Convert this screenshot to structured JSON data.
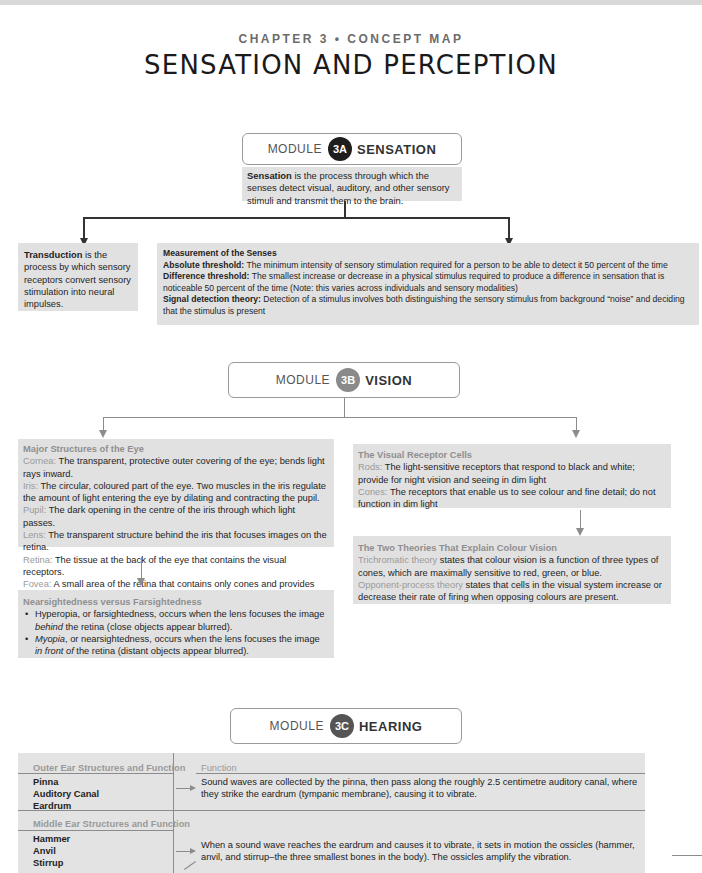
{
  "header": {
    "chapter_label": "CHAPTER 3 • CONCEPT MAP",
    "title": "SENSATION AND PERCEPTION"
  },
  "colors": {
    "badge_3a": "#1e1e1e",
    "badge_3b": "#8a8a8a",
    "badge_3c": "#555555",
    "box_fill": "#e1e1e1",
    "label_grey": "#9a9a9a"
  },
  "module_3a": {
    "word": "MODULE",
    "badge": "3A",
    "name": "SENSATION",
    "definition_term": "Sensation",
    "definition_rest": " is the process through which the senses detect visual, auditory, and other sensory stimuli and transmit them to the brain.",
    "transduction_term": "Transduction",
    "transduction_rest": " is the process by which sensory receptors convert sensory stimulation into neural impulses.",
    "measurement": {
      "heading": "Measurement of the Senses",
      "items": [
        {
          "term": "Absolute threshold:",
          "text": " The minimum intensity of sensory stimulation required for a person to be able to detect it 50 percent of the time"
        },
        {
          "term": "Difference threshold:",
          "text": " The smallest increase or decrease in a physical stimulus required to produce a difference in sensation that is noticeable 50 percent of the time (Note: this varies across individuals and sensory modalities)"
        },
        {
          "term": "Signal detection theory:",
          "text": " Detection of a stimulus involves both distinguishing the sensory stimulus from background “noise” and deciding that the stimulus is present"
        }
      ]
    }
  },
  "module_3b": {
    "word": "MODULE",
    "badge": "3B",
    "name": "VISION",
    "eye_structures": {
      "heading": "Major Structures of the Eye",
      "items": [
        {
          "term": "Cornea:",
          "text": " The transparent, protective outer covering of the eye; bends light rays inward."
        },
        {
          "term": "Iris:",
          "text": " The circular, coloured part of the eye. Two muscles in the iris regulate the amount of light entering the eye by dilating and contracting the pupil."
        },
        {
          "term": "Pupil:",
          "text": " The dark opening in the centre of the iris through which light passes."
        },
        {
          "term": "Lens:",
          "text": " The transparent structure behind the iris that focuses images on the retina."
        },
        {
          "term": "Retina:",
          "text": " The tissue at the back of the eye that contains the visual receptors."
        },
        {
          "term": "Fovea:",
          "text": " A small area of the retina that contains only cones and provides the sharpest, clearest vision."
        }
      ]
    },
    "sightedness": {
      "heading": "Nearsightedness versus Farsightedness",
      "b1_pre": "Hyperopia, or farsightedness, occurs when the lens focuses the image ",
      "b1_em": "behind",
      "b1_post": " the retina (close objects appear blurred).",
      "b2_em1": "Myopia",
      "b2_mid": ", or nearsightedness, occurs when the lens focuses the image ",
      "b2_em2": "in front of",
      "b2_post": " the retina (distant objects appear blurred)."
    },
    "receptors": {
      "heading": "The Visual Receptor Cells",
      "items": [
        {
          "term": "Rods:",
          "text": " The light-sensitive receptors that respond to black and white; provide for night vision and seeing in dim light"
        },
        {
          "term": "Cones:",
          "text": " The receptors that enable us to see colour and fine detail; do not function in dim light"
        }
      ]
    },
    "colour_theories": {
      "heading": "The Two Theories That Explain Colour Vision",
      "items": [
        {
          "term": "Trichromatic theory",
          "text": " states that colour vision is a function of three types of cones, which are maximally sensitive to red, green, or blue."
        },
        {
          "term": "Opponent-process theory",
          "text": " states that cells in the visual system increase or decrease their rate of firing when opposing colours are present."
        }
      ]
    }
  },
  "module_3c": {
    "word": "MODULE",
    "badge": "3C",
    "name": "HEARING",
    "function_header": "Function",
    "outer": {
      "heading": "Outer Ear Structures and Function",
      "structures": [
        "Pinna",
        "Auditory Canal",
        "Eardrum"
      ],
      "function": "Sound waves are collected by the pinna, then pass along the roughly 2.5 centimetre auditory canal, where they strike the eardrum (tympanic membrane), causing it to vibrate."
    },
    "middle": {
      "heading": "Middle Ear Structures and Function",
      "structures": [
        "Hammer",
        "Anvil",
        "Stirrup"
      ],
      "function": "When a sound wave reaches the eardrum and causes it to vibrate, it sets in motion the ossicles (hammer, anvil, and stirrup–the three smallest bones in the body). The ossicles amplify the vibration."
    }
  }
}
